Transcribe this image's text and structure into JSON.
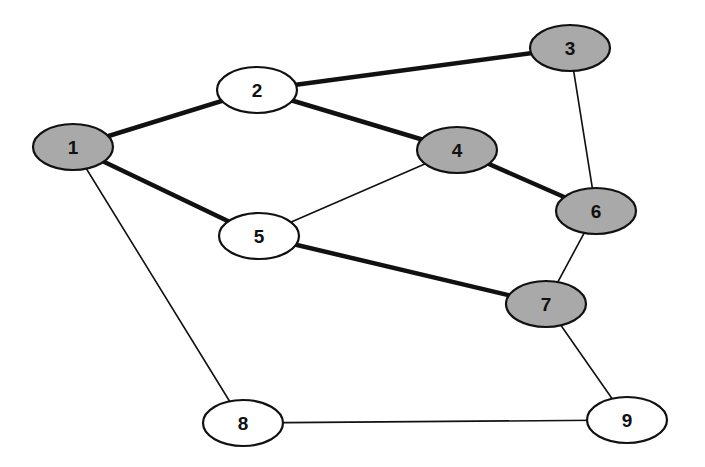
{
  "diagram": {
    "type": "undirected-graph",
    "colors": {
      "background": "#ffffff",
      "stroke": "#111111",
      "shaded_fill": "#a9a9a9",
      "unshaded_fill": "#ffffff"
    },
    "nodes": [
      {
        "id": "1",
        "label": "1",
        "cx": 73,
        "cy": 147,
        "shaded": true
      },
      {
        "id": "2",
        "label": "2",
        "cx": 257,
        "cy": 90,
        "shaded": false
      },
      {
        "id": "3",
        "label": "3",
        "cx": 570,
        "cy": 48,
        "shaded": true
      },
      {
        "id": "4",
        "label": "4",
        "cx": 457,
        "cy": 150,
        "shaded": true
      },
      {
        "id": "5",
        "label": "5",
        "cx": 259,
        "cy": 236,
        "shaded": false
      },
      {
        "id": "6",
        "label": "6",
        "cx": 596,
        "cy": 211,
        "shaded": true
      },
      {
        "id": "7",
        "label": "7",
        "cx": 546,
        "cy": 304,
        "shaded": true
      },
      {
        "id": "8",
        "label": "8",
        "cx": 243,
        "cy": 423,
        "shaded": false
      },
      {
        "id": "9",
        "label": "9",
        "cx": 627,
        "cy": 420,
        "shaded": false
      }
    ],
    "edges": [
      {
        "from": "1",
        "to": "2",
        "bold": true
      },
      {
        "from": "2",
        "to": "3",
        "bold": true
      },
      {
        "from": "2",
        "to": "4",
        "bold": true
      },
      {
        "from": "1",
        "to": "5",
        "bold": true
      },
      {
        "from": "4",
        "to": "6",
        "bold": true
      },
      {
        "from": "5",
        "to": "7",
        "bold": true
      },
      {
        "from": "1",
        "to": "8",
        "bold": false
      },
      {
        "from": "5",
        "to": "4",
        "bold": false
      },
      {
        "from": "3",
        "to": "6",
        "bold": false
      },
      {
        "from": "6",
        "to": "7",
        "bold": false
      },
      {
        "from": "7",
        "to": "9",
        "bold": false
      },
      {
        "from": "8",
        "to": "9",
        "bold": false
      }
    ],
    "node_rx": 40,
    "node_ry": 23
  }
}
